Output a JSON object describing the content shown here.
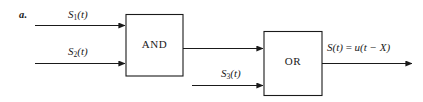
{
  "figure": {
    "item_letter": "a.",
    "type": "logic-block-diagram",
    "background_color": "#ffffff",
    "stroke_color": "#1a1a1a",
    "text_color": "#1a1a1a"
  },
  "gates": {
    "and": {
      "label": "AND",
      "inputs": [
        "S1(t)",
        "S2(t)"
      ],
      "output_to": "OR"
    },
    "or": {
      "label": "OR",
      "inputs": [
        "AND output",
        "S3(t)"
      ],
      "output": "S(t) = u(t - X)"
    }
  },
  "signals": {
    "s1": {
      "name": "S",
      "index": "1",
      "arg": "(t)"
    },
    "s2": {
      "name": "S",
      "index": "2",
      "arg": "(t)"
    },
    "s3": {
      "name": "S",
      "index": "3",
      "arg": "(t)"
    },
    "output": {
      "name": "S",
      "arg": "(t)",
      "equals": "=",
      "expr_fn": "u",
      "expr_arg": "(t − X)"
    }
  }
}
